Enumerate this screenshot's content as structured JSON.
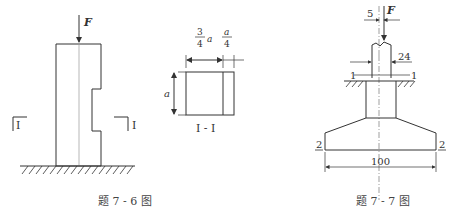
{
  "figure_7_6": {
    "force_label": "F",
    "section_mark_left": "I",
    "section_mark_right": "I",
    "caption": "题 7 - 6 图"
  },
  "section_view": {
    "dim_top_left_num": "3",
    "dim_top_left_den": "4",
    "dim_top_left_var": "a",
    "dim_top_right_num": "a",
    "dim_top_right_den": "4",
    "dim_side": "a",
    "caption": "I - I"
  },
  "figure_7_7": {
    "force_label": "F",
    "offset_dim": "5",
    "column_width_dim": "24",
    "section_1_left": "1",
    "section_1_right": "1",
    "section_2_left": "2",
    "section_2_right": "2",
    "base_width_dim": "100",
    "caption": "题 7 - 7 图"
  }
}
